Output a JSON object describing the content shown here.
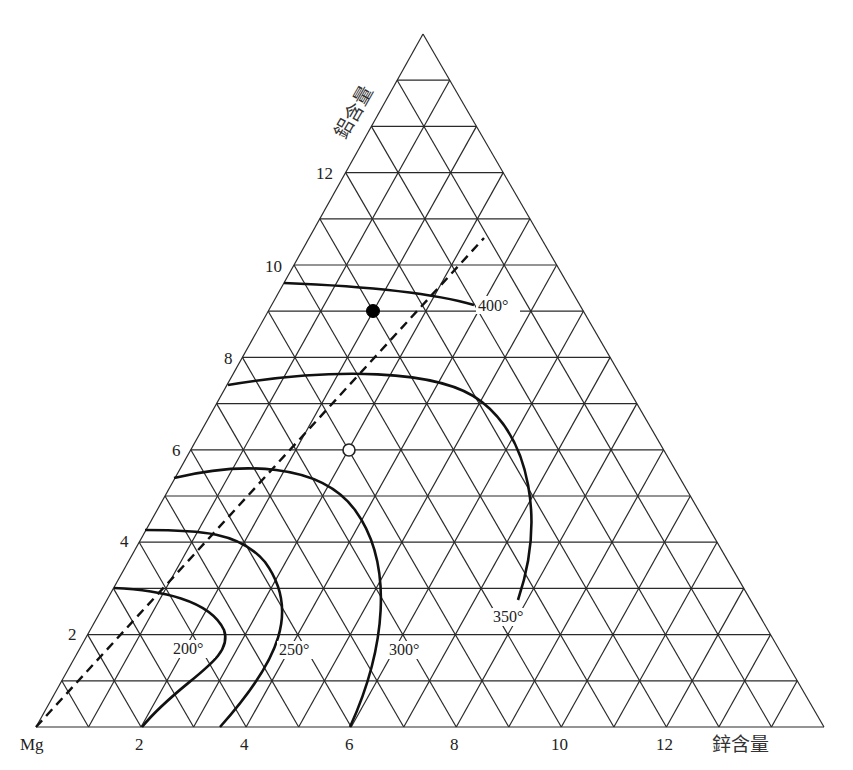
{
  "diagram": {
    "type": "ternary",
    "corner_label": "Mg",
    "bottom_axis_title": "鋅含量",
    "left_axis_title": "鋁含量",
    "bottom_ticks": [
      "2",
      "4",
      "6",
      "8",
      "10",
      "12"
    ],
    "left_ticks": [
      "2",
      "4",
      "6",
      "8",
      "10",
      "12"
    ],
    "divisions": 15,
    "isotherms": [
      {
        "label": "200°"
      },
      {
        "label": "250°"
      },
      {
        "label": "300°"
      },
      {
        "label": "350°"
      },
      {
        "label": "400°"
      }
    ],
    "points": [
      {
        "name": "solid-point",
        "fill": "#000000"
      },
      {
        "name": "open-point",
        "fill": "#ffffff"
      }
    ],
    "colors": {
      "line": "#111111",
      "grid": "#2a2a2a",
      "background": "#ffffff"
    }
  }
}
